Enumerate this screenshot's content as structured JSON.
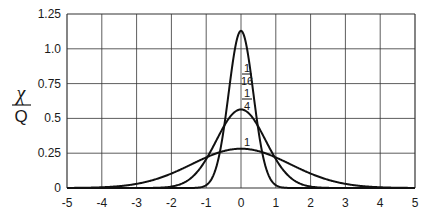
{
  "chart_data": {
    "type": "line",
    "title": "",
    "xlabel": "",
    "ylabel_numerator": "χ",
    "ylabel_denominator": "Q",
    "xlim": [
      -5,
      5
    ],
    "ylim": [
      0,
      1.25
    ],
    "grid": true,
    "x_ticks": [
      "-5",
      "-4",
      "-3",
      "-2",
      "-1",
      "0",
      "1",
      "2",
      "3",
      "4",
      "5"
    ],
    "y_ticks": [
      "0",
      "0.25",
      "0.5",
      "0.75",
      "1.0",
      "1.25"
    ],
    "series": [
      {
        "name": "1/16",
        "label_num": "1",
        "label_den": "16",
        "t": 0.0625,
        "peak": 1.128,
        "x": [
          -1.5,
          -1,
          -0.75,
          -0.5,
          -0.25,
          0,
          0.25,
          0.5,
          0.75,
          1,
          1.5
        ],
        "y": [
          0.0,
          0.021,
          0.118,
          0.415,
          0.878,
          1.128,
          0.878,
          0.415,
          0.118,
          0.021,
          0.0
        ]
      },
      {
        "name": "1/4",
        "label_num": "1",
        "label_den": "4",
        "t": 0.25,
        "peak": 0.564,
        "x": [
          -2.5,
          -2,
          -1.5,
          -1,
          -0.5,
          0,
          0.5,
          1,
          1.5,
          2,
          2.5
        ],
        "y": [
          0.001,
          0.01,
          0.059,
          0.208,
          0.44,
          0.564,
          0.44,
          0.208,
          0.059,
          0.01,
          0.001
        ]
      },
      {
        "name": "1",
        "label_num": "1",
        "label_den": "",
        "t": 1,
        "peak": 0.282,
        "x": [
          -4,
          -3,
          -2,
          -1,
          0,
          1,
          2,
          3,
          4
        ],
        "y": [
          0.005,
          0.03,
          0.104,
          0.22,
          0.282,
          0.22,
          0.104,
          0.03,
          0.005
        ]
      }
    ]
  }
}
